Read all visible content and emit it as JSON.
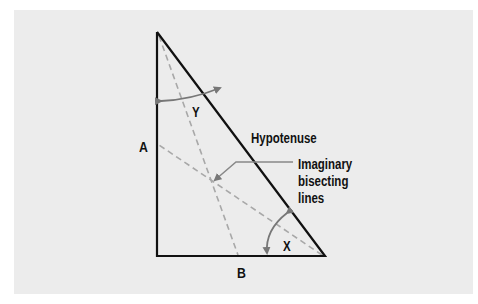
{
  "diagram": {
    "type": "right-triangle",
    "labels": {
      "side_a": "A",
      "side_b": "B",
      "hypotenuse": "Hypotenuse",
      "angle_y": "Y",
      "angle_x": "X",
      "callout_line1": "Imaginary",
      "callout_line2": "bisecting",
      "callout_line3": "lines"
    },
    "colors": {
      "background": "#ececec",
      "triangle_stroke": "#111111",
      "dashed_lines": "#a8a8a8",
      "arrows": "#777777",
      "text": "#111111"
    },
    "vertices": {
      "top": [
        157,
        32
      ],
      "bottom_left": [
        157,
        256
      ],
      "bottom_right": [
        325,
        256
      ]
    }
  }
}
